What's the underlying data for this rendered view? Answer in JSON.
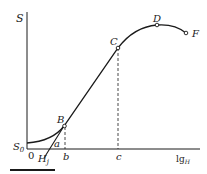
{
  "diagram": {
    "y_axis_label": "S",
    "x_axis_label": "lg",
    "x_axis_label_sub": "H",
    "origin_label": "0",
    "s0_label": "S",
    "s0_sub": "0",
    "hj_label": "H",
    "hj_sub": "j",
    "angle_label": "a",
    "tick_b": "b",
    "tick_c": "c",
    "points": {
      "B": "B",
      "C": "C",
      "D": "D",
      "F": "F"
    },
    "colors": {
      "line": "#1a1a1a",
      "background": "#ffffff"
    }
  }
}
